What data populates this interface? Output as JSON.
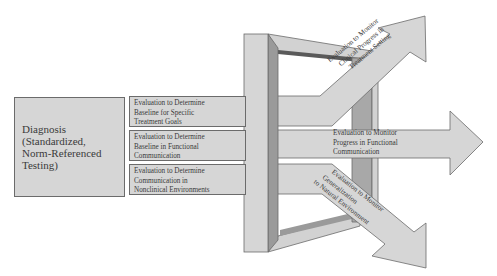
{
  "diagnosis": {
    "lines": [
      "Diagnosis",
      "(Standardized,",
      "Norm-Referenced",
      "Testing)"
    ]
  },
  "determine_boxes": [
    {
      "lines": [
        "Evaluation to Determine",
        "Baseline for Specific",
        "Treatment Goals"
      ]
    },
    {
      "lines": [
        "Evaluation to Determine",
        "Baseline in Functional",
        "Communication"
      ]
    },
    {
      "lines": [
        "Evaluation to Determine",
        "Communication in",
        "Nonclinical Environments"
      ]
    }
  ],
  "monitor_arrows": [
    {
      "direction": "up-right",
      "lines": [
        "Evaluation to Monitor",
        "Clinical Progress in",
        "Treatment Setting"
      ]
    },
    {
      "direction": "right",
      "lines": [
        "Evaluation to Monitor",
        "Progress in Functional",
        "Communication"
      ]
    },
    {
      "direction": "down-right",
      "lines": [
        "Evaluation to Monitor",
        "Generalization",
        "to Natural Environment"
      ]
    }
  ],
  "colors": {
    "fill": "#d6d6d6",
    "stroke": "#6b6b6b",
    "frame_shadow": "#9a9a9a",
    "frame_dark": "#5a5a5a"
  }
}
